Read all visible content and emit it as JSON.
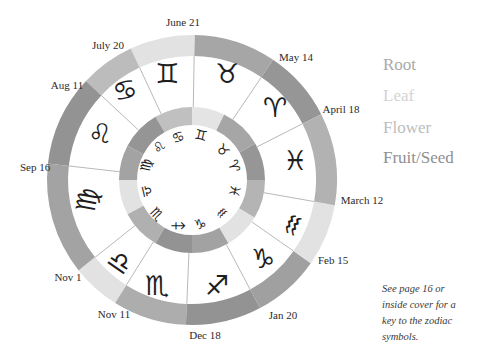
{
  "diagram": {
    "center": [
      192,
      180
    ],
    "outer_ring": {
      "r_outer": 145,
      "r_inner": 124
    },
    "inner_ring": {
      "r_outer": 73,
      "r_inner": 55
    },
    "divider_color": "#9a9a9a",
    "outer_segments": [
      {
        "sign": "Aries",
        "symbol": "♈",
        "element": "Fruit/Seed",
        "start": 27,
        "end": 56,
        "color": "#969696",
        "symbol_pos": [
          275,
          107
        ],
        "rotate": 0
      },
      {
        "sign": "Taurus",
        "symbol": "♉",
        "element": "Root",
        "start": 56,
        "end": 89,
        "color": "#a6a6a6",
        "symbol_pos": [
          227,
          73
        ],
        "rotate": 0
      },
      {
        "sign": "Gemini",
        "symbol": "♊",
        "element": "Flower",
        "start": 89,
        "end": 115,
        "color": "#e2e2e2",
        "symbol_pos": [
          167,
          73
        ],
        "rotate": 0
      },
      {
        "sign": "Cancer",
        "symbol": "♋",
        "element": "Leaf",
        "start": 115,
        "end": 137,
        "color": "#bcbcbc",
        "symbol_pos": [
          125,
          90
        ],
        "rotate": -15
      },
      {
        "sign": "Leo",
        "symbol": "♌",
        "element": "Fruit/Seed",
        "start": 137,
        "end": 173.5,
        "color": "#939393",
        "symbol_pos": [
          100,
          133
        ],
        "rotate": 0
      },
      {
        "sign": "Virgo",
        "symbol": "♍",
        "element": "Root",
        "start": 173.5,
        "end": 218.6,
        "color": "#a3a3a3",
        "symbol_pos": [
          87,
          200
        ],
        "rotate": -80
      },
      {
        "sign": "Libra",
        "symbol": "♎",
        "element": "Flower",
        "start": 218.6,
        "end": 238,
        "color": "#e2e2e2",
        "symbol_pos": [
          120,
          262
        ],
        "rotate": 35
      },
      {
        "sign": "Scorpio",
        "symbol": "♏",
        "element": "Leaf",
        "start": 238,
        "end": 267.6,
        "color": "#adadad",
        "symbol_pos": [
          157,
          285
        ],
        "rotate": 0
      },
      {
        "sign": "Sagittarius",
        "symbol": "♐",
        "element": "Fruit/Seed",
        "start": 267.6,
        "end": 298,
        "color": "#939393",
        "symbol_pos": [
          217,
          285
        ],
        "rotate": 0
      },
      {
        "sign": "Capricorn",
        "symbol": "♑",
        "element": "Root",
        "start": 298,
        "end": 325,
        "color": "#a0a0a0",
        "symbol_pos": [
          263,
          258
        ],
        "rotate": 0
      },
      {
        "sign": "Aquarius",
        "symbol": "♒",
        "element": "Flower",
        "start": 325,
        "end": 350,
        "color": "#e2e2e2",
        "symbol_pos": [
          293,
          225
        ],
        "rotate": -65
      },
      {
        "sign": "Pisces",
        "symbol": "♓",
        "element": "Leaf",
        "start": 350,
        "end": 387,
        "color": "#b2b2b2",
        "symbol_pos": [
          295,
          160
        ],
        "rotate": 0
      }
    ],
    "inner_segments": [
      {
        "sign": "Aries",
        "symbol": "♈",
        "start": 0,
        "end": 30,
        "color": "#969696",
        "symbol_pos": [
          234,
          166
        ],
        "rotate": 74
      },
      {
        "sign": "Taurus",
        "symbol": "♉",
        "start": 30,
        "end": 64,
        "color": "#a6a6a6",
        "symbol_pos": [
          223,
          150
        ],
        "rotate": 46
      },
      {
        "sign": "Gemini",
        "symbol": "♊",
        "start": 64,
        "end": 90,
        "color": "#e4e4e4",
        "symbol_pos": [
          201,
          135
        ],
        "rotate": 13
      },
      {
        "sign": "Cancer",
        "symbol": "♋",
        "start": 90,
        "end": 120,
        "color": "#c0c0c0",
        "symbol_pos": [
          178,
          137
        ],
        "rotate": -19
      },
      {
        "sign": "Leo",
        "symbol": "♌",
        "start": 120,
        "end": 152,
        "color": "#959595",
        "symbol_pos": [
          159,
          147
        ],
        "rotate": -48
      },
      {
        "sign": "Virgo",
        "symbol": "♍",
        "start": 152,
        "end": 180,
        "color": "#a3a3a3",
        "symbol_pos": [
          146,
          165
        ],
        "rotate": -78
      },
      {
        "sign": "Libra",
        "symbol": "♎",
        "start": 180,
        "end": 208,
        "color": "#e2e2e2",
        "symbol_pos": [
          147,
          191
        ],
        "rotate": 77
      },
      {
        "sign": "Scorpio",
        "symbol": "♏",
        "start": 208,
        "end": 240,
        "color": "#b0b0b0",
        "symbol_pos": [
          157,
          214
        ],
        "rotate": 47
      },
      {
        "sign": "Sagittarius",
        "symbol": "♐",
        "start": 240,
        "end": 270,
        "color": "#939393",
        "symbol_pos": [
          178,
          226
        ],
        "rotate": 45
      },
      {
        "sign": "Capricorn",
        "symbol": "♑",
        "start": 270,
        "end": 300,
        "color": "#a2a2a2",
        "symbol_pos": [
          200,
          224
        ],
        "rotate": -10
      },
      {
        "sign": "Aquarius",
        "symbol": "♒",
        "start": 300,
        "end": 329,
        "color": "#e2e2e2",
        "symbol_pos": [
          222,
          213
        ],
        "rotate": -43
      },
      {
        "sign": "Pisces",
        "symbol": "♓",
        "start": 329,
        "end": 360,
        "color": "#b4b4b4",
        "symbol_pos": [
          235,
          191
        ],
        "rotate": -77
      }
    ],
    "boundaries": [
      {
        "label": "June 21",
        "angle": 89,
        "pos": [
          183,
          26
        ]
      },
      {
        "label": "July 20",
        "angle": 115,
        "pos": [
          108,
          49
        ]
      },
      {
        "label": "Aug 11",
        "angle": 137,
        "pos": [
          67,
          89
        ]
      },
      {
        "label": "Sep 16",
        "angle": 173.5,
        "pos": [
          35,
          171
        ]
      },
      {
        "label": "Nov 1",
        "angle": 218.6,
        "pos": [
          68,
          281
        ]
      },
      {
        "label": "Nov 11",
        "angle": 238,
        "pos": [
          114,
          318
        ]
      },
      {
        "label": "Dec 18",
        "angle": 267.6,
        "pos": [
          205,
          339
        ]
      },
      {
        "label": "Jan 20",
        "angle": 298,
        "pos": [
          283,
          319
        ]
      },
      {
        "label": "Feb 15",
        "angle": 325,
        "pos": [
          333,
          264
        ]
      },
      {
        "label": "March 12",
        "angle": 350,
        "pos": [
          362,
          204
        ]
      },
      {
        "label": "April 18",
        "angle": 27,
        "pos": [
          341,
          113
        ]
      },
      {
        "label": "May 14",
        "angle": 56,
        "pos": [
          296,
          61
        ]
      }
    ]
  },
  "legend": {
    "items": [
      {
        "label": "Root",
        "color": "#a9a9a9",
        "baseline": 70
      },
      {
        "label": "Leaf",
        "color": "#d3d3d3",
        "baseline": 101
      },
      {
        "label": "Flower",
        "color": "#bdbdbd",
        "baseline": 133
      },
      {
        "label": "Fruit/Seed",
        "color": "#8f8f8f",
        "baseline": 163
      }
    ]
  },
  "note": {
    "lines": [
      "See page 16 or",
      "inside cover for a",
      "key to the zodiac",
      "symbols."
    ]
  }
}
